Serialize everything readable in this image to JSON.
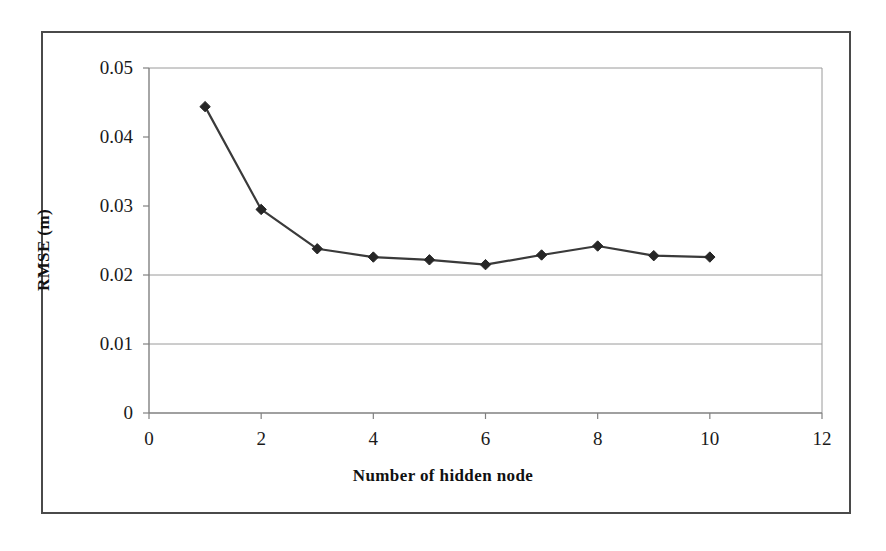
{
  "chart_data": {
    "type": "line",
    "title": "",
    "xlabel": "Number of hidden node",
    "ylabel": "RMSE (m)",
    "xlim": [
      0,
      12
    ],
    "ylim": [
      0,
      0.05
    ],
    "xticks": [
      "0",
      "2",
      "4",
      "6",
      "8",
      "10",
      "12"
    ],
    "xtick_values": [
      0,
      2,
      4,
      6,
      8,
      10,
      12
    ],
    "yticks": [
      "0",
      "0.01",
      "0.02",
      "0.03",
      "0.04",
      "0.05"
    ],
    "ytick_values": [
      0,
      0.01,
      0.02,
      0.03,
      0.04,
      0.05
    ],
    "grid": "horizontal",
    "gridlines_at": [
      0.01,
      0.02
    ],
    "legend": "none",
    "marker": "diamond",
    "line_color": "#3a3a3a",
    "marker_color": "#262626",
    "series": [
      {
        "name": "RMSE",
        "x": [
          1,
          2,
          3,
          4,
          5,
          6,
          7,
          8,
          9,
          10
        ],
        "values": [
          0.0444,
          0.0295,
          0.0238,
          0.0226,
          0.0222,
          0.0215,
          0.0229,
          0.0242,
          0.0228,
          0.0226
        ]
      }
    ]
  },
  "axes": {
    "y_title": "RMSE (m)",
    "x_title": "Number of hidden node"
  },
  "colors": {
    "frame": "#4a4a4a",
    "axis": "#808080",
    "grid": "#9a9a9a",
    "line": "#3a3a3a",
    "marker": "#262626",
    "text": "#1a1a1a"
  }
}
